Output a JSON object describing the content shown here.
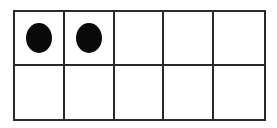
{
  "diagram": {
    "type": "ten-frame",
    "rows": 2,
    "columns": 5,
    "filled_count": 2,
    "cells": [
      {
        "row": 1,
        "col": 1,
        "filled": true
      },
      {
        "row": 1,
        "col": 2,
        "filled": true
      },
      {
        "row": 1,
        "col": 3,
        "filled": false
      },
      {
        "row": 1,
        "col": 4,
        "filled": false
      },
      {
        "row": 1,
        "col": 5,
        "filled": false
      },
      {
        "row": 2,
        "col": 1,
        "filled": false
      },
      {
        "row": 2,
        "col": 2,
        "filled": false
      },
      {
        "row": 2,
        "col": 3,
        "filled": false
      },
      {
        "row": 2,
        "col": 4,
        "filled": false
      },
      {
        "row": 2,
        "col": 5,
        "filled": false
      }
    ],
    "colors": {
      "line": "#2a2a2a",
      "dot": "#0a0a0a",
      "background": "#ffffff"
    }
  }
}
